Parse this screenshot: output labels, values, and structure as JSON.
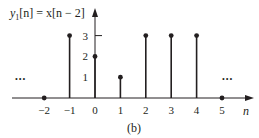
{
  "chart_data": {
    "type": "stem",
    "title_parts": {
      "y": "y",
      "sub": "1",
      "rest": "[n] = x[n − 2]"
    },
    "xlabel": "n",
    "ylabel": "",
    "caption": "(b)",
    "x": [
      -2,
      -1,
      0,
      1,
      2,
      3,
      4,
      5
    ],
    "values": [
      0,
      3,
      2,
      1,
      3,
      3,
      3,
      0
    ],
    "x_tick_labels": [
      "−2",
      "−1",
      "0",
      "1",
      "2",
      "3",
      "4",
      "5"
    ],
    "y_tick_labels": [
      "1",
      "2",
      "3"
    ],
    "y_ticks": [
      1,
      2,
      3
    ],
    "xlim": [
      -2,
      5
    ],
    "ylim": [
      0,
      3
    ],
    "continuation_left": "•••",
    "continuation_right": "•••",
    "grid": false,
    "legend": null
  },
  "colors": {
    "ink": "#231f20",
    "background": "#ffffff"
  }
}
